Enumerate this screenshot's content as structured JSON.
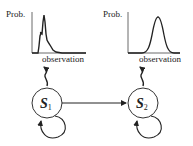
{
  "diagram": {
    "title": "",
    "states": [
      {
        "id": "S1",
        "label": "S",
        "subscript": "1"
      },
      {
        "id": "S2",
        "label": "S",
        "subscript": "2"
      }
    ],
    "transitions": [
      {
        "from": "S1",
        "to": "S1",
        "type": "self-loop"
      },
      {
        "from": "S1",
        "to": "S2",
        "type": "arrow"
      },
      {
        "from": "S2",
        "to": "S2",
        "type": "self-loop"
      }
    ],
    "emission_plots": [
      {
        "state": "S1",
        "ylabel": "Prob.",
        "xlabel": "observation",
        "shape": "multimodal-spiky"
      },
      {
        "state": "S2",
        "ylabel": "Prob.",
        "xlabel": "observation",
        "shape": "gaussian"
      }
    ],
    "colors": {
      "stroke": "#222222",
      "background": "#ffffff"
    }
  }
}
